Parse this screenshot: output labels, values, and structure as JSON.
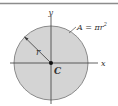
{
  "figure": {
    "type": "circle-centroid-diagram",
    "colors": {
      "fill": "#d4d4d4",
      "stroke": "#8a8a8a",
      "axis": "#3a3a3a",
      "rule": "#8c8c8c",
      "text": "#333333"
    },
    "labels": {
      "y_axis": "y",
      "x_axis": "x",
      "radius": "r",
      "centroid": "C",
      "area": "A = πr",
      "area_exponent": "2"
    }
  }
}
